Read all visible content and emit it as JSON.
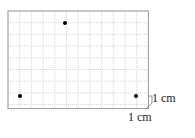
{
  "grid": {
    "cols": 12,
    "rows": 8,
    "x0": 8,
    "y0": 11,
    "cell": 11.7,
    "line_color": "#d4d4d4",
    "border_color": "#999999"
  },
  "points": [
    {
      "x": 20,
      "y": 96
    },
    {
      "x": 65,
      "y": 23
    },
    {
      "x": 136,
      "y": 96
    }
  ],
  "labels": {
    "horizontal": "1 cm",
    "vertical": "1 cm"
  }
}
